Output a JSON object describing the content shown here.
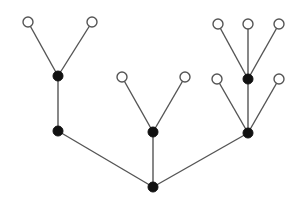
{
  "diagram": {
    "type": "rooted-tree",
    "colors": {
      "edge": "#555555",
      "internal_node": "#111111",
      "leaf_fill": "#ffffff",
      "leaf_stroke": "#555555"
    },
    "nodes": [
      {
        "id": "root",
        "kind": "internal",
        "x": 153,
        "y": 187,
        "r": 5
      },
      {
        "id": "a",
        "kind": "internal",
        "x": 58,
        "y": 131,
        "r": 5
      },
      {
        "id": "a1",
        "kind": "internal",
        "x": 58,
        "y": 76,
        "r": 5
      },
      {
        "id": "a1l1",
        "kind": "leaf",
        "x": 28,
        "y": 22,
        "r": 5
      },
      {
        "id": "a1l2",
        "kind": "leaf",
        "x": 92,
        "y": 22,
        "r": 5
      },
      {
        "id": "b",
        "kind": "internal",
        "x": 153,
        "y": 132,
        "r": 5
      },
      {
        "id": "bl1",
        "kind": "leaf",
        "x": 122,
        "y": 77,
        "r": 5
      },
      {
        "id": "bl2",
        "kind": "leaf",
        "x": 185,
        "y": 77,
        "r": 5
      },
      {
        "id": "c",
        "kind": "internal",
        "x": 248,
        "y": 133,
        "r": 5
      },
      {
        "id": "cl1",
        "kind": "leaf",
        "x": 217,
        "y": 79,
        "r": 5
      },
      {
        "id": "c1",
        "kind": "internal",
        "x": 248,
        "y": 79,
        "r": 5
      },
      {
        "id": "cl2",
        "kind": "leaf",
        "x": 279,
        "y": 79,
        "r": 5
      },
      {
        "id": "c1l1",
        "kind": "leaf",
        "x": 218,
        "y": 24,
        "r": 5
      },
      {
        "id": "c1l2",
        "kind": "leaf",
        "x": 248,
        "y": 24,
        "r": 5
      },
      {
        "id": "c1l3",
        "kind": "leaf",
        "x": 279,
        "y": 24,
        "r": 5
      }
    ],
    "edges": [
      [
        "root",
        "a"
      ],
      [
        "root",
        "b"
      ],
      [
        "root",
        "c"
      ],
      [
        "a",
        "a1"
      ],
      [
        "a1",
        "a1l1"
      ],
      [
        "a1",
        "a1l2"
      ],
      [
        "b",
        "bl1"
      ],
      [
        "b",
        "bl2"
      ],
      [
        "c",
        "cl1"
      ],
      [
        "c",
        "c1"
      ],
      [
        "c",
        "cl2"
      ],
      [
        "c1",
        "c1l1"
      ],
      [
        "c1",
        "c1l2"
      ],
      [
        "c1",
        "c1l3"
      ]
    ]
  }
}
